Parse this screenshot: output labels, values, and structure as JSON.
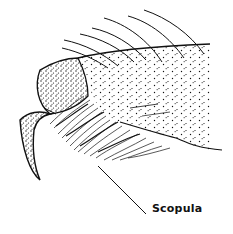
{
  "diagram": {
    "labels": [
      {
        "text": "Scopula",
        "points_to": "scopula-hair-tuft"
      }
    ]
  },
  "colors": {
    "ink": "#111111",
    "background": "#ffffff"
  }
}
